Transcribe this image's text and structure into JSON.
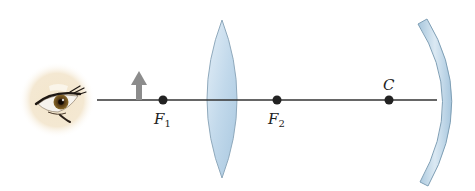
{
  "diagram": {
    "type": "optics-ray-setup",
    "elements": [
      {
        "id": "eye",
        "kind": "observer-eye",
        "x": 57,
        "y": 100
      },
      {
        "id": "object",
        "kind": "upright-arrow-object",
        "x": 139,
        "y_base": 100,
        "y_tip": 72,
        "color": "#8c8c8c"
      },
      {
        "id": "F1",
        "kind": "focal-point",
        "x": 163,
        "y": 100
      },
      {
        "id": "lens",
        "kind": "converging-lens",
        "x": 222,
        "y_top": 20,
        "y_bottom": 178,
        "color": "#c6dcec"
      },
      {
        "id": "F2",
        "kind": "focal-point",
        "x": 277,
        "y": 100
      },
      {
        "id": "C",
        "kind": "center-of-curvature",
        "x": 389,
        "y": 100
      },
      {
        "id": "mirror",
        "kind": "concave-mirror",
        "x": 440,
        "y_top": 22,
        "y_bottom": 180,
        "color": "#b8d4e6"
      }
    ],
    "axis": {
      "x_start": 97,
      "x_end": 445,
      "y": 100,
      "color": "#333333"
    }
  },
  "labels": {
    "f1": {
      "main": "F",
      "sub": "1"
    },
    "f2": {
      "main": "F",
      "sub": "2"
    },
    "c": {
      "main": "C"
    }
  },
  "colors": {
    "axis": "#333333",
    "point": "#222222",
    "lens_fill": "#c8ddee",
    "lens_stroke": "#8fa9bc",
    "mirror_fill": "#bcd6e8",
    "mirror_stroke": "#7f9fb5",
    "arrow": "#8c8c8c",
    "eye_glow": "#f1e2c4"
  }
}
